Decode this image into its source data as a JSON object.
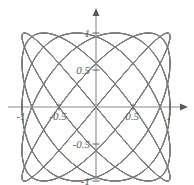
{
  "figure": {
    "title": "",
    "background_color": "#ffffff",
    "width": 194,
    "height": 185
  },
  "axes": {
    "x_axis_name": "x-axis",
    "y_axis_name": "y-axis",
    "axis_color": "#8a8a8a",
    "has_arrowheads": true,
    "origin_px": {
      "x": 96,
      "y": 107
    },
    "unit_px": 74,
    "x_ticks": [
      {
        "value": -1,
        "label": "-1"
      },
      {
        "value": -0.5,
        "label": "-0.5"
      },
      {
        "value": 0.5,
        "label": "0.5"
      },
      {
        "value": 1,
        "label": "1"
      }
    ],
    "y_ticks": [
      {
        "value": 1,
        "label": "1"
      },
      {
        "value": 0.5,
        "label": "0.5"
      },
      {
        "value": -0.5,
        "label": "-0.5"
      },
      {
        "value": -1,
        "label": "-1"
      }
    ]
  },
  "chart_data": {
    "type": "line",
    "title": "",
    "xlabel": "",
    "ylabel": "",
    "xlim": [
      -1.15,
      1.15
    ],
    "ylim": [
      -1.15,
      1.15
    ],
    "grid": false,
    "legend": "none",
    "curve_color": "#7d7d7d",
    "curve_width": 0.9,
    "series": [
      {
        "name": "lissajous-5-6-p0",
        "a": 5,
        "b": 6,
        "phase": 0.0
      },
      {
        "name": "lissajous-5-6-p1",
        "a": 5,
        "b": 6,
        "phase": 0.5235987755982988
      },
      {
        "name": "lissajous-5-6-p2",
        "a": 5,
        "b": 6,
        "phase": 1.0471975511965976
      },
      {
        "name": "lissajous-5-6-p3",
        "a": 5,
        "b": 6,
        "phase": 1.5707963267948966
      },
      {
        "name": "lissajous-5-6-p4",
        "a": 5,
        "b": 6,
        "phase": 2.0943951023931953
      },
      {
        "name": "lissajous-5-6-p5",
        "a": 5,
        "b": 6,
        "phase": 2.6179938779914944
      }
    ],
    "samples_per_curve": 900,
    "t_range": [
      0,
      6.283185307179586
    ]
  }
}
